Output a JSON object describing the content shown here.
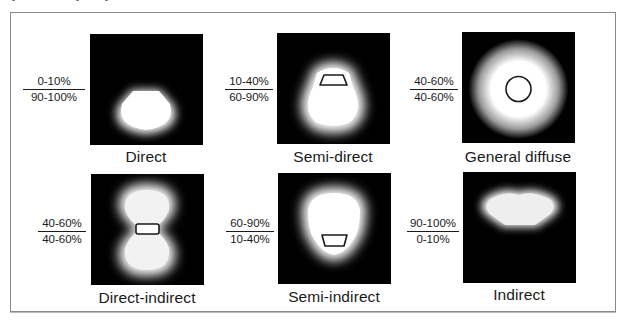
{
  "figure": {
    "legend_note": "Upper value = upward light (uplight), lower value = downward light (downlight)",
    "colors": {
      "background": "#ffffff",
      "panel": "#000000",
      "glow": "#ffffff",
      "outline": "#1a1a1a",
      "frame": "#8a8a8a"
    },
    "panels": [
      {
        "id": "direct",
        "label": "Direct",
        "uplight": "0-10%",
        "downlight": "90-100%",
        "luminaire_shape": "none",
        "glow_shape": "downward-bell"
      },
      {
        "id": "semi-direct",
        "label": "Semi-direct",
        "uplight": "10-40%",
        "downlight": "60-90%",
        "luminaire_shape": "trapezoid-open-bottom",
        "glow_shape": "mostly-down"
      },
      {
        "id": "general-diffuse",
        "label": "General diffuse",
        "uplight": "40-60%",
        "downlight": "40-60%",
        "luminaire_shape": "circle",
        "glow_shape": "round"
      },
      {
        "id": "direct-indirect",
        "label": "Direct-indirect",
        "uplight": "40-60%",
        "downlight": "40-60%",
        "luminaire_shape": "rounded-rectangle",
        "glow_shape": "hourglass"
      },
      {
        "id": "semi-indirect",
        "label": "Semi-indirect",
        "uplight": "60-90%",
        "downlight": "10-40%",
        "luminaire_shape": "trapezoid-open-top",
        "glow_shape": "mostly-up"
      },
      {
        "id": "indirect",
        "label": "Indirect",
        "uplight": "90-100%",
        "downlight": "0-10%",
        "luminaire_shape": "none",
        "glow_shape": "upward-bowl"
      }
    ]
  }
}
